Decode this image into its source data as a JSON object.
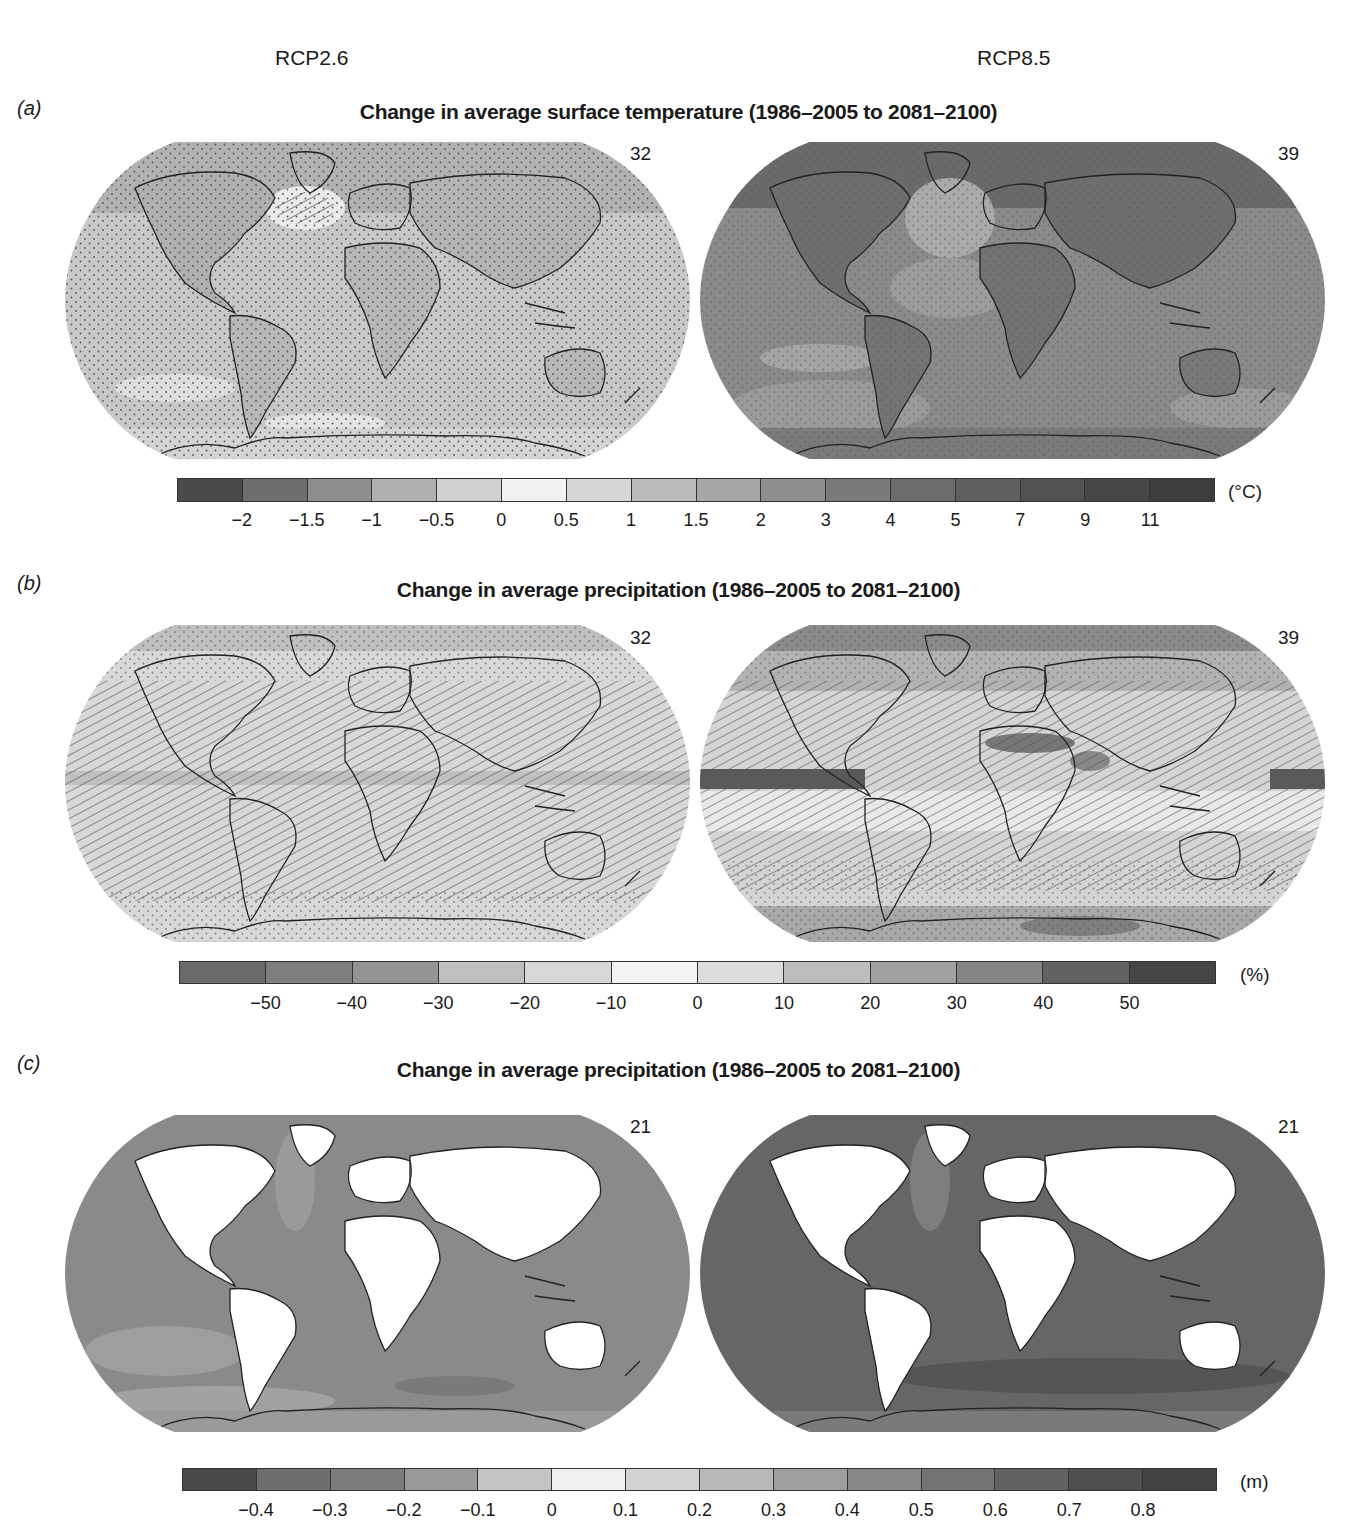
{
  "header": {
    "scenario_left": "RCP2.6",
    "scenario_right": "RCP8.5"
  },
  "panels": {
    "a": {
      "letter": "(a)",
      "title": "Change in average surface temperature (1986–2005 to 2081–2100)",
      "left_count": "32",
      "right_count": "39",
      "unit": "(°C)",
      "colorbar": {
        "colors": [
          "#4a4a4a",
          "#6e6e6e",
          "#8e8e8e",
          "#b0b0b0",
          "#d0d0d0",
          "#f2f2f2",
          "#d6d6d6",
          "#bcbcbc",
          "#a6a6a6",
          "#8f8f8f",
          "#7a7a7a",
          "#6c6c6c",
          "#5f5f5f",
          "#525252",
          "#474747",
          "#3d3d3d"
        ],
        "ticks": [
          "−2",
          "−1.5",
          "−1",
          "−0.5",
          "0",
          "0.5",
          "1",
          "1.5",
          "2",
          "3",
          "4",
          "5",
          "7",
          "9",
          "11"
        ]
      }
    },
    "b": {
      "letter": "(b)",
      "title": "Change in average precipitation (1986–2005 to 2081–2100)",
      "left_count": "32",
      "right_count": "39",
      "unit": "(%)",
      "colorbar": {
        "colors": [
          "#6a6a6a",
          "#7e7e7e",
          "#949494",
          "#bfbfbf",
          "#d8d8d8",
          "#f3f3f3",
          "#dcdcdc",
          "#bdbdbd",
          "#a1a1a1",
          "#858585",
          "#626262",
          "#454545"
        ],
        "ticks": [
          "−50",
          "−40",
          "−30",
          "−20",
          "−10",
          "0",
          "10",
          "20",
          "30",
          "40",
          "50"
        ]
      }
    },
    "c": {
      "letter": "(c)",
      "title": "Change in average precipitation (1986–2005 to 2081–2100)",
      "left_count": "21",
      "right_count": "21",
      "unit": "(m)",
      "colorbar": {
        "colors": [
          "#4a4a4a",
          "#6e6e6e",
          "#7c7c7c",
          "#9a9a9a",
          "#c4c4c4",
          "#f0f0f0",
          "#d2d2d2",
          "#b8b8b8",
          "#9e9e9e",
          "#878787",
          "#737373",
          "#626262",
          "#4e4e4e",
          "#424242"
        ],
        "ticks": [
          "−0.4",
          "−0.3",
          "−0.2",
          "−0.1",
          "0",
          "0.1",
          "0.2",
          "0.3",
          "0.4",
          "0.5",
          "0.6",
          "0.7",
          "0.8"
        ]
      }
    }
  },
  "chart_data": [
    {
      "type": "heatmap",
      "title": "Change in average surface temperature (1986–2005 to 2081–2100)",
      "panel": "(a)",
      "subplots": [
        {
          "scenario": "RCP2.6",
          "model_count": 32,
          "dominant_range": "0.5–2 °C over ocean, 1.5–3 °C over land, up to 3–4 °C in Arctic"
        },
        {
          "scenario": "RCP8.5",
          "model_count": 39,
          "dominant_range": "2–5 °C over ocean, 4–7 °C over land, 7–11 °C in Arctic"
        }
      ],
      "colorbar": {
        "unit": "°C",
        "bounds": [
          -2,
          -1.5,
          -1,
          -0.5,
          0,
          0.5,
          1,
          1.5,
          2,
          3,
          4,
          5,
          7,
          9,
          11
        ],
        "tick_labels": [
          "−2",
          "−1.5",
          "−1",
          "−0.5",
          "0",
          "0.5",
          "1",
          "1.5",
          "2",
          "3",
          "4",
          "5",
          "7",
          "9",
          "11"
        ]
      },
      "hatching": "hatched = not significant; stippled = robust/significant"
    },
    {
      "type": "heatmap",
      "title": "Change in average precipitation (1986–2005 to 2081–2100)",
      "panel": "(b)",
      "subplots": [
        {
          "scenario": "RCP2.6",
          "model_count": 32,
          "dominant_range": "−10 to +10 % most areas, +10–20 % equatorial Pacific & high latitudes"
        },
        {
          "scenario": "RCP8.5",
          "model_count": 39,
          "dominant_range": "−30 to −10 % subtropics, +20–50 % equatorial Pacific & high latitudes"
        }
      ],
      "colorbar": {
        "unit": "%",
        "bounds": [
          -50,
          -40,
          -30,
          -20,
          -10,
          0,
          10,
          20,
          30,
          40,
          50
        ],
        "tick_labels": [
          "−50",
          "−40",
          "−30",
          "−20",
          "−10",
          "0",
          "10",
          "20",
          "30",
          "40",
          "50"
        ]
      }
    },
    {
      "type": "heatmap",
      "title": "Change in average precipitation (1986–2005 to 2081–2100)",
      "panel": "(c)",
      "subplots": [
        {
          "scenario": "RCP2.6",
          "model_count": 21,
          "dominant_range": "0.2–0.5 m ocean"
        },
        {
          "scenario": "RCP8.5",
          "model_count": 21,
          "dominant_range": "0.4–0.8 m ocean"
        }
      ],
      "colorbar": {
        "unit": "m",
        "bounds": [
          -0.4,
          -0.3,
          -0.2,
          -0.1,
          0,
          0.1,
          0.2,
          0.3,
          0.4,
          0.5,
          0.6,
          0.7,
          0.8
        ],
        "tick_labels": [
          "−0.4",
          "−0.3",
          "−0.2",
          "−0.1",
          "0",
          "0.1",
          "0.2",
          "0.3",
          "0.4",
          "0.5",
          "0.6",
          "0.7",
          "0.8"
        ]
      },
      "land_masked": true
    }
  ]
}
